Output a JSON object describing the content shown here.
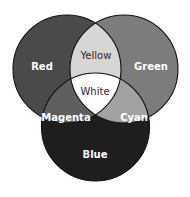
{
  "diagram": {
    "type": "venn-3",
    "title": "",
    "background": "#ffffff",
    "circles": [
      {
        "id": "red",
        "label": "Red",
        "cx": 67,
        "cy": 69,
        "r": 54,
        "fill": "#4a4a4a"
      },
      {
        "id": "green",
        "label": "Green",
        "cx": 124,
        "cy": 69,
        "r": 54,
        "fill": "#7c7c7c"
      },
      {
        "id": "blue",
        "label": "Blue",
        "cx": 95.5,
        "cy": 127,
        "r": 54,
        "fill": "#1e1e1e"
      }
    ],
    "regions": {
      "red": {
        "label": "Red",
        "x": 42,
        "y": 67,
        "fill": "#4a4a4a"
      },
      "green": {
        "label": "Green",
        "x": 151,
        "y": 67,
        "fill": "#7c7c7c"
      },
      "blue": {
        "label": "Blue",
        "x": 95,
        "y": 155,
        "fill": "#1e1e1e"
      },
      "yellow": {
        "label": "Yellow",
        "x": 96,
        "y": 56,
        "fill": "#d6d6d6"
      },
      "magenta": {
        "label": "Magenta",
        "x": 66,
        "y": 118,
        "fill": "#5f5f5f"
      },
      "cyan": {
        "label": "Cyan",
        "x": 134,
        "y": 118,
        "fill": "#a2a2a2"
      },
      "white": {
        "label": "White",
        "x": 95,
        "y": 92,
        "fill": "#ffffff"
      }
    }
  }
}
